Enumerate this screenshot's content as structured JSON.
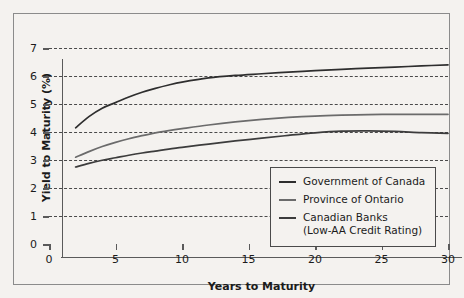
{
  "chart_data": {
    "type": "line",
    "title": "",
    "xlabel": "Years to Maturity",
    "ylabel": "Yield to Maturity (%)",
    "xlim": [
      0,
      30
    ],
    "ylim": [
      0,
      7
    ],
    "xticks": [
      "0",
      "5",
      "10",
      "15",
      "20",
      "25",
      "30"
    ],
    "yticks": [
      "0",
      "1",
      "2",
      "3",
      "4",
      "5",
      "6",
      "7"
    ],
    "grid": "horizontal-dashed",
    "legend_position": "lower-right-inside",
    "x": [
      2,
      3,
      4,
      5,
      6,
      7,
      8,
      9,
      10,
      12,
      14,
      16,
      18,
      20,
      22,
      24,
      26,
      28,
      30
    ],
    "series": [
      {
        "name": "Government of Canada",
        "color": "#2e2e2e",
        "values": [
          4.15,
          4.55,
          4.85,
          5.05,
          5.25,
          5.42,
          5.56,
          5.68,
          5.78,
          5.93,
          6.02,
          6.08,
          6.14,
          6.19,
          6.24,
          6.28,
          6.32,
          6.36,
          6.4
        ]
      },
      {
        "name": "Province of Ontario",
        "color": "#6b6b6b",
        "values": [
          3.1,
          3.3,
          3.48,
          3.63,
          3.76,
          3.87,
          3.97,
          4.05,
          4.12,
          4.25,
          4.36,
          4.45,
          4.52,
          4.57,
          4.6,
          4.62,
          4.63,
          4.63,
          4.63
        ]
      },
      {
        "name": "Canadian Banks",
        "color": "#3c3c3c",
        "values": [
          2.75,
          2.88,
          2.99,
          3.08,
          3.17,
          3.25,
          3.32,
          3.39,
          3.45,
          3.57,
          3.68,
          3.78,
          3.88,
          3.97,
          4.03,
          4.04,
          4.02,
          3.98,
          3.95
        ]
      }
    ],
    "legend": [
      {
        "label": "Government of Canada",
        "sublabel": "",
        "color": "#2e2e2e"
      },
      {
        "label": "Province of Ontario",
        "sublabel": "",
        "color": "#6b6b6b"
      },
      {
        "label": "Canadian Banks",
        "sublabel": "(Low-AA Credit Rating)",
        "color": "#3c3c3c"
      }
    ]
  },
  "axes": {
    "y_title": "Yield to Maturity (%)",
    "x_title": "Years to Maturity"
  }
}
